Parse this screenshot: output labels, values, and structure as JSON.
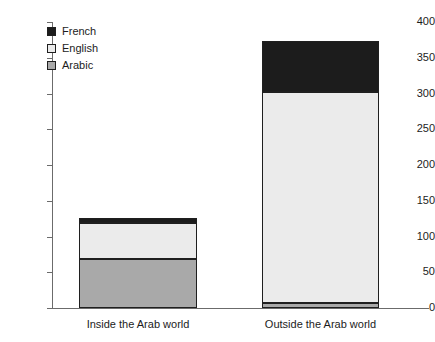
{
  "chart_data": {
    "type": "bar",
    "title": "",
    "xlabel": "",
    "ylabel": "",
    "stacked": true,
    "grid": false,
    "legend_position": "top-left",
    "ylim": [
      0,
      400
    ],
    "yticks": [
      0,
      50,
      100,
      150,
      200,
      250,
      300,
      350,
      400
    ],
    "ytick_labels": [
      "0",
      "50",
      "100",
      "150",
      "200",
      "250",
      "300",
      "350",
      "400"
    ],
    "categories": [
      "Inside the Arab world",
      "Outside the Arab world"
    ],
    "series": [
      {
        "name": "Arabic",
        "color": "#a9a9a9",
        "values": [
          68,
          7
        ]
      },
      {
        "name": "English",
        "color": "#ebebeb",
        "values": [
          51,
          295
        ]
      },
      {
        "name": "French",
        "color": "#1c1c1c",
        "values": [
          7,
          71
        ]
      }
    ],
    "totals": [
      126,
      373
    ],
    "stack_order_bottom_to_top": [
      "Arabic",
      "English",
      "French"
    ]
  },
  "legend": {
    "items": [
      {
        "label": "French",
        "color": "#1c1c1c"
      },
      {
        "label": "English",
        "color": "#ebebeb"
      },
      {
        "label": "Arabic",
        "color": "#a9a9a9"
      }
    ]
  },
  "axis": {
    "line_color": "#6b6b6b",
    "tick_text_color": "#1c1c1c"
  }
}
